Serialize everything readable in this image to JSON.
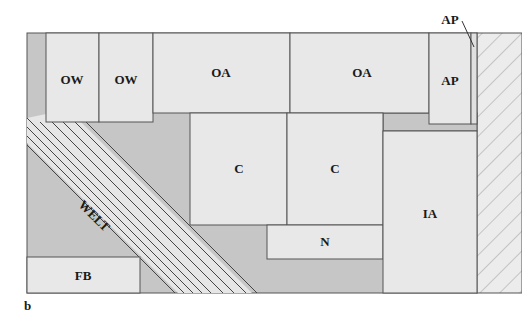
{
  "figure": {
    "panel_label": "b",
    "colors": {
      "room_fill": "#e8e8e8",
      "background_gray": "#c4c4c4",
      "outline": "#555555",
      "hatch": "#8c8c8c"
    },
    "regions": [
      {
        "id": "ow-1",
        "label": "OW"
      },
      {
        "id": "ow-2",
        "label": "OW"
      },
      {
        "id": "oa-1",
        "label": "OA"
      },
      {
        "id": "oa-2",
        "label": "OA"
      },
      {
        "id": "ap-main",
        "label": "AP"
      },
      {
        "id": "ap-callout",
        "label": "AP"
      },
      {
        "id": "c-1",
        "label": "C"
      },
      {
        "id": "c-2",
        "label": "C"
      },
      {
        "id": "n",
        "label": "N"
      },
      {
        "id": "ia",
        "label": "IA"
      },
      {
        "id": "fb",
        "label": "FB"
      },
      {
        "id": "welt",
        "label": "WELT"
      }
    ]
  }
}
